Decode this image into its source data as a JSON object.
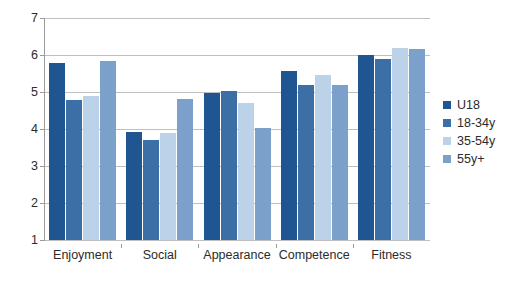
{
  "chart_data": {
    "type": "bar",
    "title": "",
    "subtitle": "",
    "xlabel": "",
    "ylabel": "",
    "categories": [
      "Enjoyment",
      "Social",
      "Appearance",
      "Competence",
      "Fitness"
    ],
    "series": [
      {
        "name": "U18",
        "color": "#1f5691",
        "values": [
          5.78,
          3.93,
          4.98,
          5.57,
          6.0
        ]
      },
      {
        "name": "18-34y",
        "color": "#3c6fa5",
        "values": [
          4.78,
          3.7,
          5.03,
          5.18,
          5.88
        ]
      },
      {
        "name": "35-54y",
        "color": "#bcd2e8",
        "values": [
          4.88,
          3.88,
          4.7,
          5.47,
          6.2
        ]
      },
      {
        "name": "55y+",
        "color": "#7ba0c9",
        "values": [
          5.85,
          4.8,
          4.03,
          5.18,
          6.15
        ]
      }
    ],
    "ylim": [
      1,
      7
    ],
    "yticks": [
      "1",
      "2",
      "3",
      "4",
      "5",
      "6",
      "7"
    ],
    "grid": true,
    "legend_position": "right",
    "bar_baseline": 1
  },
  "legend": {
    "entries": [
      {
        "label": "U18"
      },
      {
        "label": "18-34y"
      },
      {
        "label": "35-54y"
      },
      {
        "label": "55y+"
      }
    ]
  }
}
